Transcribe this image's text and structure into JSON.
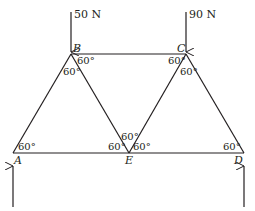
{
  "diagram": {
    "type": "truss",
    "colors": {
      "line": "#231f20",
      "background": "#ffffff"
    },
    "nodes": {
      "A": {
        "label": "A",
        "x": 13,
        "y": 153
      },
      "B": {
        "label": "B",
        "x": 71,
        "y": 54
      },
      "C": {
        "label": "C",
        "x": 186,
        "y": 54
      },
      "D": {
        "label": "D",
        "x": 244,
        "y": 153
      },
      "E": {
        "label": "E",
        "x": 129,
        "y": 153
      }
    },
    "members": [
      "AB",
      "BE",
      "BC",
      "CE",
      "CD",
      "AE",
      "ED"
    ],
    "loads": [
      {
        "node": "B",
        "label": "50 N",
        "direction": "down"
      },
      {
        "node": "C",
        "label": "90 N",
        "direction": "down"
      }
    ],
    "reactions": [
      {
        "node": "A",
        "direction": "up"
      },
      {
        "node": "D",
        "direction": "up"
      }
    ],
    "angles": {
      "A": "60°",
      "B_right": "60°",
      "B_inner": "60°",
      "C_left": "60°",
      "C_inner": "60°",
      "E_left": "60°",
      "E_top": "60°",
      "E_right": "60°",
      "D": "60°"
    }
  }
}
